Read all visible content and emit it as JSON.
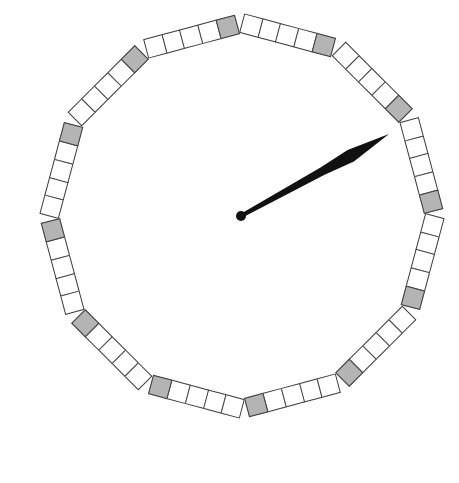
{
  "dial": {
    "center": [
      242,
      216
    ],
    "segment_distance": 186,
    "segments": 12,
    "cells_per_segment": 5,
    "cell_size": 20,
    "colors": {
      "cell_fill": "#ffffff",
      "cell_border": "#3a3a3a",
      "hour_mark_fill": "#b4b4b4",
      "hand_fill": "#111111",
      "background": "#ffffff"
    }
  },
  "hand": {
    "pivot": [
      241,
      216
    ],
    "tip": [
      389,
      134
    ],
    "pivot_radius": 5,
    "pointing_minute": 10
  }
}
